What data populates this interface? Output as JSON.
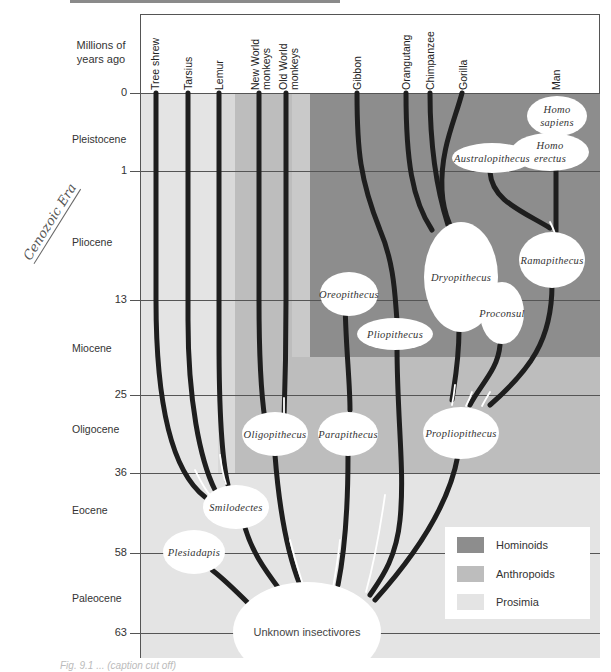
{
  "figure": {
    "axis_title": "Millions of years ago",
    "axis_title_lines": [
      "Millions of",
      "years ago"
    ],
    "handwritten_note": "Cenozoic Era",
    "caption": "Fig. 9.1 ... (caption cut off)"
  },
  "taxa": [
    {
      "label": "Tree shrew"
    },
    {
      "label": "Tarsius"
    },
    {
      "label": "Lemur"
    },
    {
      "label": "New World monkeys",
      "lines": [
        "New World",
        "monkeys"
      ]
    },
    {
      "label": "Old World monkeys",
      "lines": [
        "Old World",
        "monkeys"
      ]
    },
    {
      "label": "Gibbon"
    },
    {
      "label": "Orangutang"
    },
    {
      "label": "Chimpanzee"
    },
    {
      "label": "Gorilla"
    },
    {
      "label": "Man"
    }
  ],
  "time_ticks": [
    {
      "label": "0"
    },
    {
      "label": "1"
    },
    {
      "label": "13"
    },
    {
      "label": "25"
    },
    {
      "label": "36"
    },
    {
      "label": "58"
    },
    {
      "label": "63"
    }
  ],
  "epochs": [
    {
      "label": "Pleistocene"
    },
    {
      "label": "Pliocene"
    },
    {
      "label": "Miocene"
    },
    {
      "label": "Oligocene"
    },
    {
      "label": "Eocene"
    },
    {
      "label": "Paleocene"
    }
  ],
  "nodes": {
    "homo_sapiens": [
      "Homo",
      "sapiens"
    ],
    "homo_erectus": [
      "Homo",
      "erectus"
    ],
    "australopithecus": "Australopithecus",
    "dryopithecus": "Dryopithecus",
    "ramapithecus": "Ramapithecus",
    "oreopithecus": "Oreopithecus",
    "pliopithecus": "Pliopithecus",
    "proconsul": "Proconsul",
    "oligopithecus": "Oligopithecus",
    "parapithecus": "Parapithecus",
    "propliopithecus": "Propliopithecus",
    "smilodectes": "Smilodectes",
    "plesiadapis": "Plesiadapis",
    "unknown_insectivores": "Unknown insectivores"
  },
  "legend": {
    "items": [
      {
        "label": "Hominoids",
        "color": "#8d8d8d"
      },
      {
        "label": "Anthropoids",
        "color": "#bdbdbd"
      },
      {
        "label": "Prosimia",
        "color": "#e4e4e4"
      }
    ]
  },
  "colors": {
    "hominoids": "#8d8d8d",
    "anthropoids": "#bdbdbd",
    "prosimia": "#e4e4e4",
    "lineage": "#1e1e1e"
  }
}
